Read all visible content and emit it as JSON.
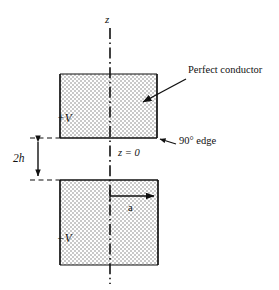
{
  "figure": {
    "background_color": "#ffffff",
    "line_color": "#111111",
    "plate_fill_color": "#e3e3e3",
    "labels": {
      "z_axis": "z",
      "upper_plate_potential": "+V",
      "lower_plate_potential": "−V",
      "origin": "z = 0",
      "gap_dimension": "2h",
      "plate_half_width": "a",
      "conductor_callout": "Perfect conductor",
      "edge_callout_degrees": "90°",
      "edge_callout_word": "edge",
      "edge_callout": "90° edge"
    },
    "geometry": {
      "axis_x": 110,
      "axis_top_y": 28,
      "axis_bottom_y": 284,
      "upper_plate": {
        "x": 60,
        "y": 74,
        "width": 97,
        "height": 64
      },
      "lower_plate": {
        "x": 60,
        "y": 180,
        "width": 98,
        "height": 85
      },
      "gap_top_y": 138,
      "gap_bottom_y": 180,
      "dimension_arrow_x": 38,
      "a_arrow_y": 196,
      "a_arrow_x_start": 110,
      "a_arrow_x_end": 156
    }
  }
}
